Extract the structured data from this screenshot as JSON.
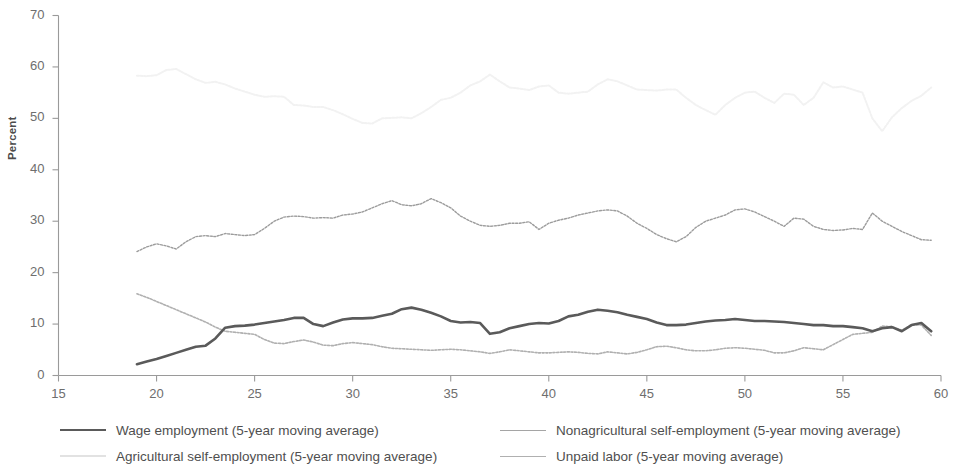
{
  "chart_data": {
    "type": "line",
    "title": "",
    "subtitle": "",
    "xlabel": "",
    "ylabel": "Percent",
    "xlim": [
      15,
      60
    ],
    "ylim": [
      0,
      70
    ],
    "xticks": [
      15,
      20,
      25,
      30,
      35,
      40,
      45,
      50,
      55,
      60
    ],
    "yticks": [
      0,
      10,
      20,
      30,
      40,
      50,
      60,
      70
    ],
    "grid": false,
    "legend_position": "bottom",
    "series": [
      {
        "name": "Wage employment (5-year moving average)",
        "color": "#5a5a5a",
        "width": 2.6,
        "dash": "none",
        "x": [
          19,
          19.5,
          20,
          20.5,
          21,
          21.5,
          22,
          22.5,
          23,
          23.5,
          24,
          24.5,
          25,
          25.5,
          26,
          26.5,
          27,
          27.5,
          28,
          28.5,
          29,
          29.5,
          30,
          30.5,
          31,
          31.5,
          32,
          32.5,
          33,
          33.5,
          34,
          34.5,
          35,
          35.5,
          36,
          36.5,
          37,
          37.5,
          38,
          38.5,
          39,
          39.5,
          40,
          40.5,
          41,
          41.5,
          42,
          42.5,
          43,
          43.5,
          44,
          44.5,
          45,
          45.5,
          46,
          46.5,
          47,
          47.5,
          48,
          48.5,
          49,
          49.5,
          50,
          50.5,
          51,
          51.5,
          52,
          52.5,
          53,
          53.5,
          54,
          54.5,
          55,
          55.5,
          56,
          56.5,
          57,
          57.5,
          58,
          58.5,
          59,
          59.5
        ],
        "y": [
          2.2,
          2.7,
          3.2,
          3.8,
          4.4,
          5.0,
          5.6,
          5.8,
          7.2,
          9.3,
          9.6,
          9.7,
          9.9,
          10.2,
          10.5,
          10.8,
          11.2,
          11.2,
          10.0,
          9.6,
          10.3,
          10.9,
          11.1,
          11.1,
          11.2,
          11.6,
          12.0,
          12.9,
          13.2,
          12.8,
          12.2,
          11.5,
          10.6,
          10.3,
          10.4,
          10.2,
          8.1,
          8.4,
          9.2,
          9.6,
          10.0,
          10.2,
          10.1,
          10.6,
          11.5,
          11.8,
          12.4,
          12.8,
          12.6,
          12.3,
          11.8,
          11.4,
          11.0,
          10.3,
          9.8,
          9.8,
          9.9,
          10.2,
          10.5,
          10.7,
          10.8,
          11.0,
          10.8,
          10.6,
          10.6,
          10.5,
          10.4,
          10.2,
          10.0,
          9.8,
          9.8,
          9.6,
          9.6,
          9.4,
          9.2,
          8.6,
          9.2,
          9.4,
          8.6,
          9.8,
          10.2,
          8.6
        ]
      },
      {
        "name": "Agricultural self-employment (5-year moving average)",
        "color": "#f2f2f2",
        "width": 2.0,
        "dash": "2,1.6",
        "x": [
          19,
          19.5,
          20,
          20.5,
          21,
          21.5,
          22,
          22.5,
          23,
          23.5,
          24,
          24.5,
          25,
          25.5,
          26,
          26.5,
          27,
          27.5,
          28,
          28.5,
          29,
          29.5,
          30,
          30.5,
          31,
          31.5,
          32,
          32.5,
          33,
          33.5,
          34,
          34.5,
          35,
          35.5,
          36,
          36.5,
          37,
          37.5,
          38,
          38.5,
          39,
          39.5,
          40,
          40.5,
          41,
          41.5,
          42,
          42.5,
          43,
          43.5,
          44,
          44.5,
          45,
          45.5,
          46,
          46.5,
          47,
          47.5,
          48,
          48.5,
          49,
          49.5,
          50,
          50.5,
          51,
          51.5,
          52,
          52.5,
          53,
          53.5,
          54,
          54.5,
          55,
          55.5,
          56,
          56.5,
          57,
          57.5,
          58,
          58.5,
          59,
          59.5
        ],
        "y": [
          58.3,
          58.2,
          58.4,
          59.4,
          59.6,
          58.6,
          57.6,
          56.9,
          57.1,
          56.6,
          55.8,
          55.2,
          54.6,
          54.2,
          54.3,
          54.2,
          52.6,
          52.5,
          52.2,
          52.2,
          51.6,
          50.8,
          49.9,
          49.1,
          49.0,
          50.0,
          50.1,
          50.2,
          50.0,
          51.0,
          52.2,
          53.6,
          54.0,
          55.0,
          56.4,
          57.2,
          58.5,
          57.2,
          56.0,
          55.8,
          55.5,
          56.2,
          56.4,
          55.0,
          54.8,
          55.0,
          55.2,
          56.6,
          57.6,
          57.2,
          56.4,
          55.6,
          55.5,
          55.4,
          55.6,
          55.6,
          54.0,
          52.6,
          51.6,
          50.7,
          52.6,
          54.0,
          55.0,
          55.2,
          54.0,
          53.0,
          54.8,
          54.6,
          52.6,
          54.0,
          57.0,
          56.0,
          56.2,
          55.6,
          55.0,
          50.0,
          47.5,
          50.2,
          52.0,
          53.4,
          54.4,
          56.0
        ]
      },
      {
        "name": "Nonagricultural self-employment (5-year moving average)",
        "color": "#9c9c9c",
        "width": 1.4,
        "dash": "2,1.6",
        "x": [
          19,
          19.5,
          20,
          20.5,
          21,
          21.5,
          22,
          22.5,
          23,
          23.5,
          24,
          24.5,
          25,
          25.5,
          26,
          26.5,
          27,
          27.5,
          28,
          28.5,
          29,
          29.5,
          30,
          30.5,
          31,
          31.5,
          32,
          32.5,
          33,
          33.5,
          34,
          34.5,
          35,
          35.5,
          36,
          36.5,
          37,
          37.5,
          38,
          38.5,
          39,
          39.5,
          40,
          40.5,
          41,
          41.5,
          42,
          42.5,
          43,
          43.5,
          44,
          44.5,
          45,
          45.5,
          46,
          46.5,
          47,
          47.5,
          48,
          48.5,
          49,
          49.5,
          50,
          50.5,
          51,
          51.5,
          52,
          52.5,
          53,
          53.5,
          54,
          54.5,
          55,
          55.5,
          56,
          56.5,
          57,
          57.5,
          58,
          58.5,
          59,
          59.5
        ],
        "y": [
          24.1,
          25.0,
          25.6,
          25.2,
          24.6,
          26.0,
          27.0,
          27.2,
          27.0,
          27.6,
          27.4,
          27.2,
          27.4,
          28.6,
          30.0,
          30.8,
          31.0,
          30.9,
          30.6,
          30.7,
          30.6,
          31.2,
          31.4,
          31.8,
          32.6,
          33.4,
          34.0,
          33.2,
          33.0,
          33.4,
          34.4,
          33.6,
          32.6,
          31.0,
          30.0,
          29.2,
          29.0,
          29.2,
          29.6,
          29.6,
          29.9,
          28.4,
          29.6,
          30.2,
          30.6,
          31.2,
          31.6,
          32.0,
          32.2,
          32.0,
          31.0,
          29.6,
          28.6,
          27.4,
          26.6,
          26.0,
          27.0,
          28.8,
          30.0,
          30.6,
          31.2,
          32.2,
          32.4,
          31.8,
          30.9,
          30.0,
          29.0,
          30.6,
          30.4,
          29.0,
          28.4,
          28.2,
          28.3,
          28.6,
          28.4,
          31.6,
          30.0,
          29.0,
          28.0,
          27.2,
          26.4,
          26.3
        ]
      },
      {
        "name": "Unpaid labor (5-year moving average)",
        "color": "#b0b0b0",
        "width": 1.6,
        "dash": "2,1.6",
        "x": [
          19,
          19.5,
          20,
          20.5,
          21,
          21.5,
          22,
          22.5,
          23,
          23.5,
          24,
          24.5,
          25,
          25.5,
          26,
          26.5,
          27,
          27.5,
          28,
          28.5,
          29,
          29.5,
          30,
          30.5,
          31,
          31.5,
          32,
          32.5,
          33,
          33.5,
          34,
          34.5,
          35,
          35.5,
          36,
          36.5,
          37,
          37.5,
          38,
          38.5,
          39,
          39.5,
          40,
          40.5,
          41,
          41.5,
          42,
          42.5,
          43,
          43.5,
          44,
          44.5,
          45,
          45.5,
          46,
          46.5,
          47,
          47.5,
          48,
          48.5,
          49,
          49.5,
          50,
          50.5,
          51,
          51.5,
          52,
          52.5,
          53,
          53.5,
          54,
          54.5,
          55,
          55.5,
          56,
          56.5,
          57,
          57.5,
          58,
          58.5,
          59,
          59.5
        ],
        "y": [
          15.9,
          15.2,
          14.4,
          13.6,
          12.8,
          12.0,
          11.2,
          10.4,
          9.4,
          8.6,
          8.4,
          8.2,
          8.0,
          7.0,
          6.3,
          6.2,
          6.6,
          6.9,
          6.5,
          5.9,
          5.8,
          6.2,
          6.4,
          6.2,
          6.0,
          5.6,
          5.3,
          5.2,
          5.1,
          5.0,
          4.9,
          5.0,
          5.1,
          5.0,
          4.8,
          4.6,
          4.3,
          4.6,
          5.0,
          4.8,
          4.6,
          4.4,
          4.4,
          4.5,
          4.6,
          4.5,
          4.3,
          4.2,
          4.6,
          4.4,
          4.2,
          4.5,
          5.0,
          5.6,
          5.7,
          5.4,
          5.0,
          4.8,
          4.8,
          5.0,
          5.3,
          5.4,
          5.3,
          5.1,
          4.9,
          4.4,
          4.4,
          4.8,
          5.4,
          5.2,
          5.0,
          6.0,
          7.0,
          8.0,
          8.2,
          8.4,
          9.6,
          9.5,
          8.8,
          9.9,
          9.8,
          7.8
        ]
      }
    ]
  },
  "axis": {
    "ylabel": "Percent",
    "ytick_labels": [
      "0",
      "10",
      "20",
      "30",
      "40",
      "50",
      "60",
      "70"
    ],
    "xtick_labels": [
      "15",
      "20",
      "25",
      "30",
      "35",
      "40",
      "45",
      "50",
      "55",
      "60"
    ],
    "axis_color": "#9a9a9a",
    "tick_text_color": "#6e6e6e"
  },
  "legend": {
    "rows": [
      {
        "left": {
          "label": "Wage employment (5-year moving average)",
          "color": "#5a5a5a",
          "thickness": "2.6px",
          "style": "solid"
        },
        "right": {
          "label": "Nonagricultural self-employment (5-year moving average)",
          "color": "#a5a5a5",
          "thickness": "1.6px",
          "style": "solid"
        }
      },
      {
        "left": {
          "label": "Agricultural self-employment (5-year moving average)",
          "color": "#e2e2e2",
          "thickness": "2px",
          "style": "solid"
        },
        "right": {
          "label": "Unpaid labor (5-year moving average)",
          "color": "#b0b0b0",
          "thickness": "1.6px",
          "style": "solid"
        }
      }
    ]
  }
}
